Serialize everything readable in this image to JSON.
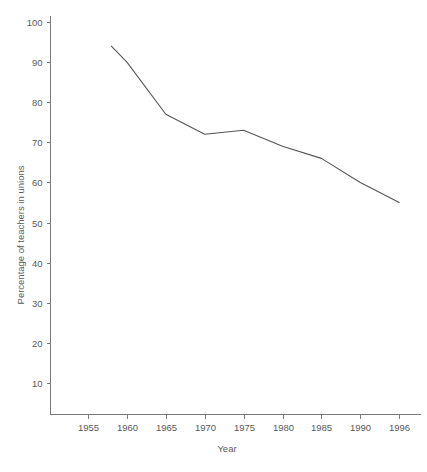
{
  "chart_data": {
    "type": "line",
    "title": "",
    "xlabel": "Year",
    "ylabel": "Percentage of teachers in unions",
    "x": [
      1958,
      1960,
      1965,
      1970,
      1975,
      1980,
      1985,
      1990,
      1996
    ],
    "values": [
      94,
      90,
      77,
      72,
      73,
      69,
      66,
      60,
      55
    ],
    "series": [
      {
        "name": "Percentage of teachers in unions",
        "values": [
          94,
          90,
          77,
          72,
          73,
          69,
          66,
          60,
          55
        ]
      }
    ],
    "xtick_labels": [
      "1955",
      "1960",
      "1965",
      "1970",
      "1975",
      "1980",
      "1985",
      "1990",
      "1996"
    ],
    "xtick_values": [
      1955,
      1960,
      1965,
      1970,
      1975,
      1980,
      1985,
      1990,
      1996
    ],
    "ytick_labels": [
      "10",
      "20",
      "30",
      "40",
      "50",
      "60",
      "70",
      "80",
      "90",
      "100"
    ],
    "ytick_values": [
      10,
      20,
      30,
      40,
      50,
      60,
      70,
      80,
      90,
      100
    ],
    "ylim": [
      0,
      105
    ],
    "xlim_category_index": [
      -0.95,
      8.5
    ],
    "grid": false,
    "legend": "none",
    "line_color": "#555555",
    "axis_color": "#7a7a7a",
    "text_color": "#5a5a5a",
    "background_color": "#ffffff"
  }
}
